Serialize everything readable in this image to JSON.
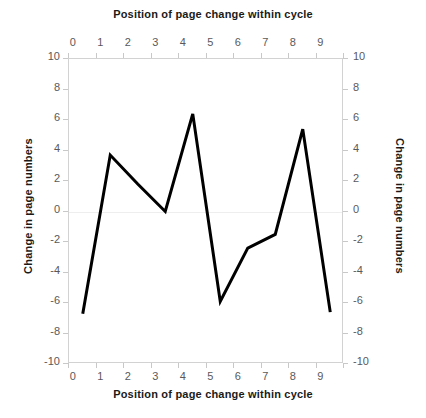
{
  "chart_data": {
    "type": "line",
    "title": "",
    "top_axis_title": "Position of page change within cycle",
    "bottom_axis_title": "Position of page change within cycle",
    "left_axis_title": "Change in page numbers",
    "right_axis_title": "Change in page numbers",
    "xlabel": "Position of page change within cycle",
    "ylabel": "Change in page numbers",
    "x": [
      0,
      1,
      2,
      3,
      4,
      5,
      6,
      7,
      8,
      9
    ],
    "values": [
      -6.7,
      3.7,
      1.8,
      0.0,
      6.4,
      -5.9,
      -2.4,
      -1.5,
      5.4,
      -6.6
    ],
    "series": [
      {
        "name": "Change in page numbers",
        "values": [
          -6.7,
          3.7,
          1.8,
          0.0,
          6.4,
          -5.9,
          -2.4,
          -1.5,
          5.4,
          -6.6
        ]
      }
    ],
    "xlim": [
      -0.5,
      9.5
    ],
    "ylim": [
      -10,
      10
    ],
    "x_ticks": [
      "0",
      "1",
      "2",
      "3",
      "4",
      "5",
      "6",
      "7",
      "8",
      "9"
    ],
    "y_ticks": [
      "10",
      "8",
      "6",
      "4",
      "2",
      "0",
      "-2",
      "-4",
      "-6",
      "-8",
      "-10"
    ],
    "grid": false,
    "legend": "none",
    "line_color": "#000000",
    "line_width": 3,
    "markers": "none",
    "axis_color": "#d2d2d2",
    "tick_label_color": "#59595b",
    "title_color": "#1a1a1a",
    "background": "#ffffff"
  }
}
